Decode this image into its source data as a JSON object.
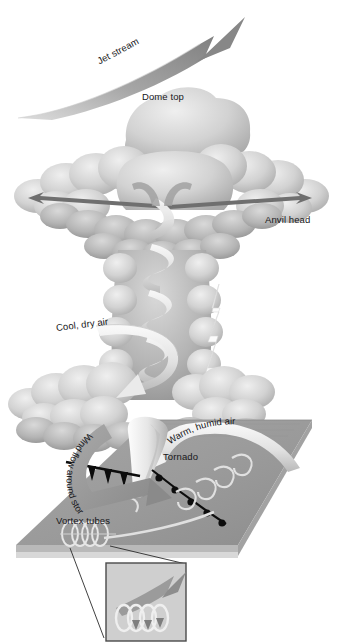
{
  "figure": {
    "domain": "diagram",
    "background_color": "#ffffff",
    "width": 341,
    "height": 643
  },
  "palette": {
    "cloud_light": "#e3e3e3",
    "cloud_mid": "#c4c4c4",
    "cloud_dark": "#a3a3a3",
    "arrow_gray": "#8e8e8e",
    "arrow_light": "#e8e8e8",
    "ground_top": "#9a9a9a",
    "ground_side": "#b9b9b9",
    "ground_edge": "#d6d6d6",
    "front_black": "#0d0d0d",
    "lightning_white": "#fbfbfb",
    "inset_border": "#4a4a4a",
    "inset_fill": "#cfcfcf",
    "leader_line": "#2a2a2a",
    "text": "#17171a"
  },
  "labels": {
    "jet_stream": "Jet stream",
    "dome_top": "Dome top",
    "anvil_head": "Anvil head",
    "cool_dry_air": "Cool, dry air",
    "warm_humid_air": "Warm, humid air",
    "tornado": "Tornado",
    "wind_flow_around_storm": "Wind flow around storm",
    "vortex_tubes": "Vortex tubes"
  },
  "elements": {
    "jet_stream_arrow": {
      "name": "jet-stream-arrow",
      "direction": "up-right",
      "tip": [
        245,
        17
      ]
    },
    "dome_top_cloud": {
      "name": "dome-top-cloud"
    },
    "anvil_spread_arrows": {
      "name": "anvil-spread-arrows",
      "direction": "bidirectional-horizontal"
    },
    "updraft_helix": {
      "name": "updraft-helix",
      "direction": "rotating-upward"
    },
    "cool_dry_downdraft": {
      "name": "cool-dry-air-arrow",
      "direction": "descending-left"
    },
    "warm_humid_inflow": {
      "name": "warm-humid-air-arrow",
      "direction": "inflow-curving"
    },
    "lightning_bolt": {
      "name": "lightning-bolt"
    },
    "tornado_funnel": {
      "name": "tornado-funnel"
    },
    "cold_front": {
      "name": "cold-front-line",
      "symbol": "triangular-pips"
    },
    "warm_front": {
      "name": "warm-front-line",
      "symbol": "semicircle-bumps"
    },
    "wind_flow_arrow": {
      "name": "wind-flow-around-storm-arrow",
      "direction": "curving-clockwise"
    },
    "vortex_tube_coils": {
      "name": "vortex-tube-coils",
      "count": 4
    },
    "ground_plane": {
      "name": "ground-plane"
    },
    "inset_box": {
      "name": "vortex-tube-inset-box",
      "contents": "magnified vortex tube with piercing arrow"
    },
    "leader_lines": {
      "name": "inset-leader-lines",
      "count": 2
    }
  }
}
